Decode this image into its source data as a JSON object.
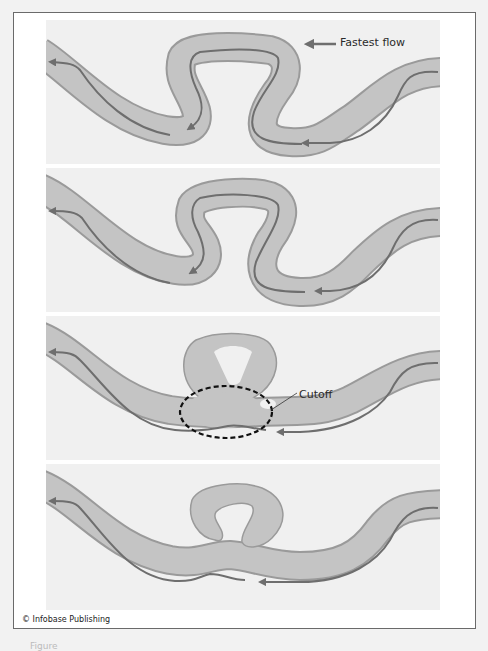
{
  "figure": {
    "type": "diagram",
    "legend": {
      "arrow_label": "Fastest flow"
    },
    "panels": [
      {
        "stage": 1,
        "description": "Meandering river with tight loop; fastest-flow line follows outer banks"
      },
      {
        "stage": 2,
        "description": "Loop neck narrows as meander grows"
      },
      {
        "stage": 3,
        "description": "Neck breached",
        "annotation": "Cutoff"
      },
      {
        "stage": 4,
        "description": "Abandoned loop isolated as oxbow lake; river straightens"
      }
    ],
    "copyright": "© Infobase Publishing",
    "caption_partial": "Figure"
  },
  "colors": {
    "page_background": "#f2f2f2",
    "frame_background": "#ffffff",
    "frame_border": "#6a6a6a",
    "panel_background": "#f0f0f0",
    "channel_fill": "#c4c4c4",
    "channel_edge": "#9a9a9a",
    "flow_line": "#6e6e6e",
    "cutoff_ellipse": "#111111"
  }
}
